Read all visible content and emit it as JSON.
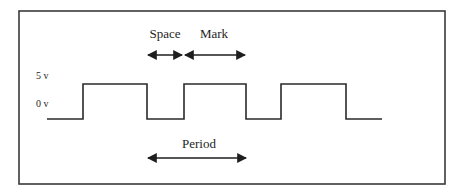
{
  "diagram": {
    "type": "square-wave timing diagram",
    "levels": {
      "high_label": "5 v",
      "low_label": "0 v"
    },
    "annotations": {
      "space_label": "Space",
      "mark_label": "Mark",
      "period_label": "Period"
    },
    "colors": {
      "line": "#2a2a2a",
      "frame": "#3a3a3a",
      "background": "#ffffff"
    },
    "waveform": {
      "points": "47,119 83,119 83,84 147,84 147,119 184,119 184,84 246,84 246,119 281,119 281,84 346,84 346,119 382,119"
    }
  }
}
